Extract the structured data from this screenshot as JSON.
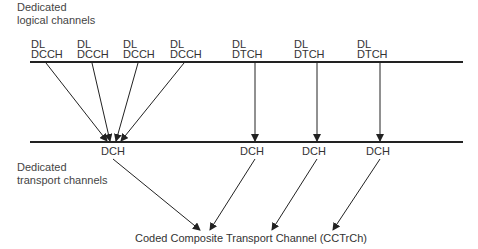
{
  "labels": {
    "logical_channels": [
      "Dedicated",
      "logical channels"
    ],
    "transport_channels": [
      "Dedicated",
      "transport channels"
    ],
    "cctrch": "Coded Composite Transport Channel (CCTrCh)"
  },
  "logical_channels": [
    {
      "line1": "DL",
      "line2": "DCCH"
    },
    {
      "line1": "DL",
      "line2": "DCCH"
    },
    {
      "line1": "DL",
      "line2": "DCCH"
    },
    {
      "line1": "DL",
      "line2": "DCCH"
    },
    {
      "line1": "DL",
      "line2": "DTCH"
    },
    {
      "line1": "DL",
      "line2": "DTCH"
    },
    {
      "line1": "DL",
      "line2": "DTCH"
    }
  ],
  "transport_channels": [
    "DCH",
    "DCH",
    "DCH",
    "DCH"
  ]
}
